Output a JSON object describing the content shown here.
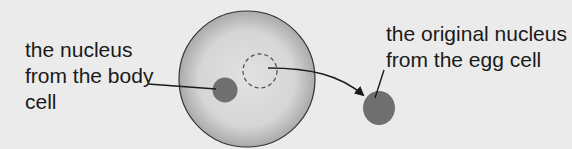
{
  "labels": {
    "body_nucleus": "the nucleus\nfrom the body\ncell",
    "egg_nucleus": "the original nucleus\nfrom the egg cell"
  },
  "colors": {
    "background": "#ebebeb",
    "cell_fill_center": "#e4e4e4",
    "cell_fill_edge": "#b4b4b4",
    "nucleus": "#6f6f6f",
    "line": "#1a1a1a"
  }
}
